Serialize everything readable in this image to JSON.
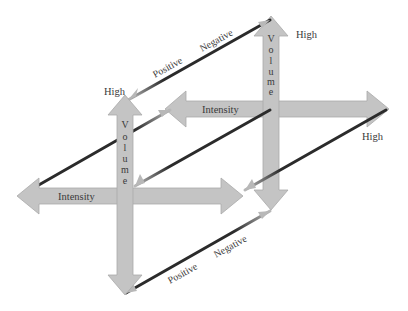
{
  "diagram": {
    "type": "two-dimensional axes (intensity × volume) with positive/negative diagonals",
    "colors": {
      "axis_fill": "#c4c4c4",
      "axis_stroke": "#a9a9a9",
      "diagonal_dark": "#2b2b2b",
      "diagonal_light": "#b8b8b8",
      "text": "#3a3a3a"
    },
    "back_volume_axis": {
      "label": "Volume",
      "end_label": "High"
    },
    "back_intensity_axis": {
      "label": "Intensity",
      "end_label": "High"
    },
    "front_volume_axis": {
      "label": "Volume",
      "end_label": "High"
    },
    "front_intensity_axis": {
      "label": "Intensity"
    },
    "top_diagonal": {
      "label_positive": "Positive",
      "label_negative": "Negative"
    },
    "bottom_diagonal": {
      "label_positive": "Positive",
      "label_negative": "Negative"
    }
  }
}
